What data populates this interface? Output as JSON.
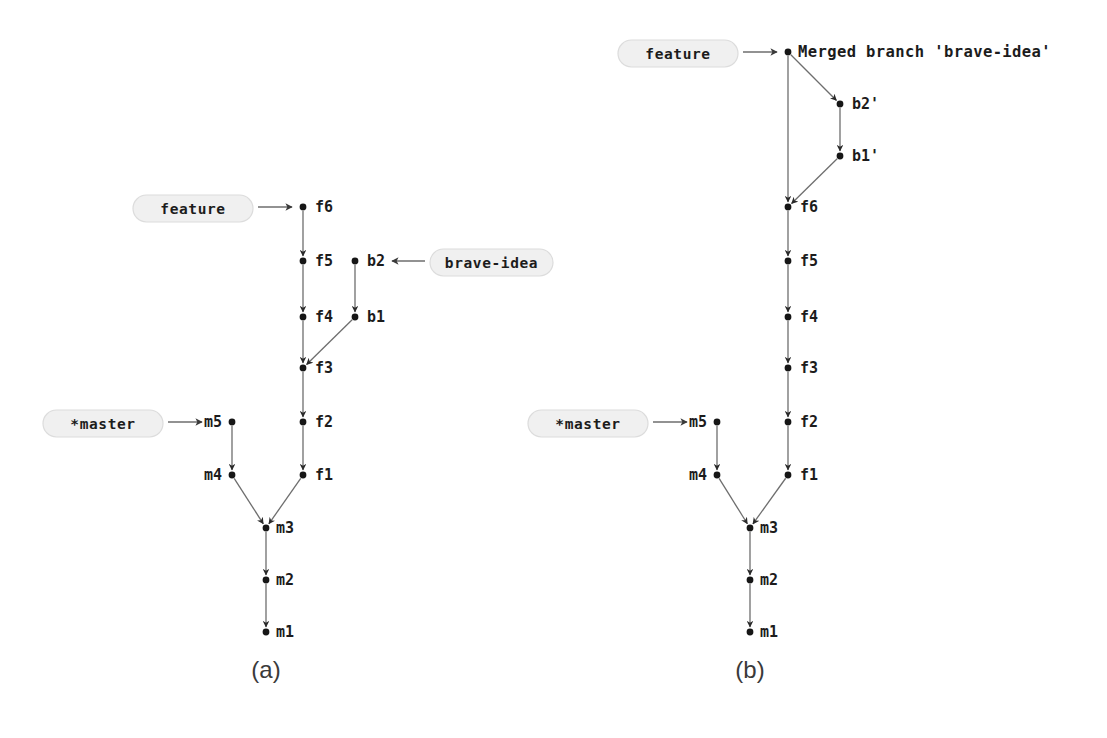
{
  "figure": {
    "type": "git-commit-graph",
    "background": "#ffffff",
    "ink_color": "#161616",
    "edge_color": "#6e6e6e",
    "pill_fill": "#f0f0f0",
    "pill_stroke": "#dcdcdc"
  },
  "panels": [
    {
      "id": "a",
      "caption": "(a)",
      "caption_pos": {
        "x": 266,
        "y": 672
      },
      "nodes": [
        {
          "id": "m1",
          "label": "m1",
          "x": 266,
          "y": 632,
          "label_dx": 10,
          "label_anchor": "start"
        },
        {
          "id": "m2",
          "label": "m2",
          "x": 266,
          "y": 580,
          "label_dx": 10,
          "label_anchor": "start"
        },
        {
          "id": "m3",
          "label": "m3",
          "x": 266,
          "y": 528,
          "label_dx": 10,
          "label_anchor": "start"
        },
        {
          "id": "m4",
          "label": "m4",
          "x": 232,
          "y": 475,
          "label_dx": -10,
          "label_anchor": "end"
        },
        {
          "id": "m5",
          "label": "m5",
          "x": 232,
          "y": 422,
          "label_dx": -10,
          "label_anchor": "end"
        },
        {
          "id": "f1",
          "label": "f1",
          "x": 303,
          "y": 475,
          "label_dx": 12,
          "label_anchor": "start"
        },
        {
          "id": "f2",
          "label": "f2",
          "x": 303,
          "y": 422,
          "label_dx": 12,
          "label_anchor": "start"
        },
        {
          "id": "f3",
          "label": "f3",
          "x": 303,
          "y": 368,
          "label_dx": 12,
          "label_anchor": "start"
        },
        {
          "id": "f4",
          "label": "f4",
          "x": 303,
          "y": 317,
          "label_dx": 12,
          "label_anchor": "start"
        },
        {
          "id": "f5",
          "label": "f5",
          "x": 303,
          "y": 261,
          "label_dx": 12,
          "label_anchor": "start"
        },
        {
          "id": "f6",
          "label": "f6",
          "x": 303,
          "y": 207,
          "label_dx": 12,
          "label_anchor": "start"
        },
        {
          "id": "b1",
          "label": "b1",
          "x": 355,
          "y": 317,
          "label_dx": 12,
          "label_anchor": "start"
        },
        {
          "id": "b2",
          "label": "b2",
          "x": 355,
          "y": 261,
          "label_dx": 12,
          "label_anchor": "start"
        }
      ],
      "edges": [
        {
          "from": "m2",
          "to": "m1"
        },
        {
          "from": "m3",
          "to": "m2"
        },
        {
          "from": "m4",
          "to": "m3"
        },
        {
          "from": "m5",
          "to": "m4"
        },
        {
          "from": "f1",
          "to": "m3"
        },
        {
          "from": "f2",
          "to": "f1"
        },
        {
          "from": "f3",
          "to": "f2"
        },
        {
          "from": "f4",
          "to": "f3"
        },
        {
          "from": "f5",
          "to": "f4"
        },
        {
          "from": "f6",
          "to": "f5"
        },
        {
          "from": "b1",
          "to": "f3"
        },
        {
          "from": "b2",
          "to": "b1"
        }
      ],
      "refs": [
        {
          "id": "feature-a",
          "text": "feature",
          "target": "f6",
          "direction": "right",
          "pill": {
            "x": 133,
            "y": 195,
            "w": 120,
            "h": 27
          },
          "arrow": {
            "x1": 258,
            "y1": 207,
            "x2": 292,
            "y2": 207
          }
        },
        {
          "id": "master-a",
          "text": "*master",
          "target": "m5",
          "direction": "right",
          "pill": {
            "x": 43,
            "y": 410,
            "w": 120,
            "h": 27
          },
          "arrow": {
            "x1": 168,
            "y1": 422,
            "x2": 202,
            "y2": 422
          }
        },
        {
          "id": "brave-idea-a",
          "text": "brave-idea",
          "target": "b2",
          "direction": "left",
          "pill": {
            "x": 430,
            "y": 249,
            "w": 123,
            "h": 27
          },
          "arrow": {
            "x1": 425,
            "y1": 261,
            "x2": 392,
            "y2": 261
          }
        }
      ]
    },
    {
      "id": "b",
      "caption": "(b)",
      "caption_pos": {
        "x": 750,
        "y": 672
      },
      "nodes": [
        {
          "id": "m1",
          "label": "m1",
          "x": 750,
          "y": 632,
          "label_dx": 10,
          "label_anchor": "start"
        },
        {
          "id": "m2",
          "label": "m2",
          "x": 750,
          "y": 580,
          "label_dx": 10,
          "label_anchor": "start"
        },
        {
          "id": "m3",
          "label": "m3",
          "x": 750,
          "y": 528,
          "label_dx": 10,
          "label_anchor": "start"
        },
        {
          "id": "m4",
          "label": "m4",
          "x": 717,
          "y": 475,
          "label_dx": -10,
          "label_anchor": "end"
        },
        {
          "id": "m5",
          "label": "m5",
          "x": 717,
          "y": 422,
          "label_dx": -10,
          "label_anchor": "end"
        },
        {
          "id": "f1",
          "label": "f1",
          "x": 788,
          "y": 475,
          "label_dx": 12,
          "label_anchor": "start"
        },
        {
          "id": "f2",
          "label": "f2",
          "x": 788,
          "y": 422,
          "label_dx": 12,
          "label_anchor": "start"
        },
        {
          "id": "f3",
          "label": "f3",
          "x": 788,
          "y": 368,
          "label_dx": 12,
          "label_anchor": "start"
        },
        {
          "id": "f4",
          "label": "f4",
          "x": 788,
          "y": 317,
          "label_dx": 12,
          "label_anchor": "start"
        },
        {
          "id": "f5",
          "label": "f5",
          "x": 788,
          "y": 261,
          "label_dx": 12,
          "label_anchor": "start"
        },
        {
          "id": "f6",
          "label": "f6",
          "x": 788,
          "y": 207,
          "label_dx": 12,
          "label_anchor": "start"
        },
        {
          "id": "b1p",
          "label": "b1'",
          "x": 840,
          "y": 156,
          "label_dx": 12,
          "label_anchor": "start"
        },
        {
          "id": "b2p",
          "label": "b2'",
          "x": 840,
          "y": 104,
          "label_dx": 12,
          "label_anchor": "start"
        },
        {
          "id": "merge",
          "label": "Merged branch 'brave-idea'",
          "x": 788,
          "y": 52,
          "label_dx": 10,
          "label_anchor": "start",
          "is_merge": true
        }
      ],
      "edges": [
        {
          "from": "m2",
          "to": "m1"
        },
        {
          "from": "m3",
          "to": "m2"
        },
        {
          "from": "m4",
          "to": "m3"
        },
        {
          "from": "m5",
          "to": "m4"
        },
        {
          "from": "f1",
          "to": "m3"
        },
        {
          "from": "f2",
          "to": "f1"
        },
        {
          "from": "f3",
          "to": "f2"
        },
        {
          "from": "f4",
          "to": "f3"
        },
        {
          "from": "f5",
          "to": "f4"
        },
        {
          "from": "f6",
          "to": "f5"
        },
        {
          "from": "b1p",
          "to": "f6"
        },
        {
          "from": "b2p",
          "to": "b1p"
        },
        {
          "from": "merge",
          "to": "f6"
        },
        {
          "from": "merge",
          "to": "b2p"
        }
      ],
      "refs": [
        {
          "id": "feature-b",
          "text": "feature",
          "target": "merge",
          "direction": "right",
          "pill": {
            "x": 618,
            "y": 40,
            "w": 120,
            "h": 27
          },
          "arrow": {
            "x1": 743,
            "y1": 52,
            "x2": 777,
            "y2": 52
          }
        },
        {
          "id": "master-b",
          "text": "*master",
          "target": "m5",
          "direction": "right",
          "pill": {
            "x": 528,
            "y": 410,
            "w": 120,
            "h": 27
          },
          "arrow": {
            "x1": 653,
            "y1": 422,
            "x2": 687,
            "y2": 422
          }
        }
      ]
    }
  ]
}
